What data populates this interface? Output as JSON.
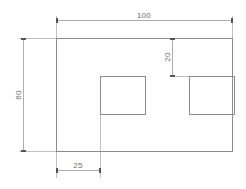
{
  "drawing": {
    "type": "orthographic-plate-view",
    "background_color": "#ffffff",
    "line_color": "#8c8c8c",
    "dimension_line_color": "#9a9a9a",
    "text_color": "#6e6e6e",
    "units_note": ""
  },
  "dimensions": {
    "overall_width": {
      "label": "100",
      "orientation": "horizontal",
      "position": "top"
    },
    "overall_height": {
      "label": "60",
      "orientation": "vertical-rotated",
      "position": "left"
    },
    "cutout_top_offset": {
      "label": "20",
      "orientation": "vertical-rotated",
      "position": "interior-right"
    },
    "cutout_left_offset": {
      "label": "25",
      "orientation": "horizontal",
      "position": "bottom"
    }
  },
  "features": {
    "plate": {
      "name": "main-outline"
    },
    "cutout_left": {
      "name": "left-square-cutout"
    },
    "cutout_right": {
      "name": "right-square-cutout"
    }
  }
}
